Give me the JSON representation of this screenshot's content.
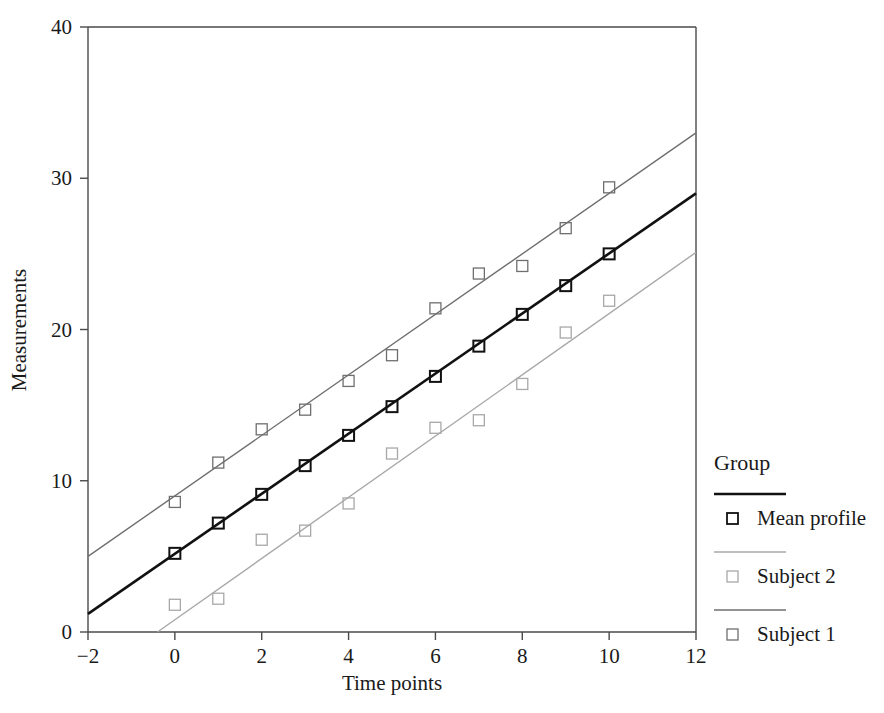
{
  "chart_data": {
    "type": "scatter",
    "title": "",
    "xlabel": "Time points",
    "ylabel": "Measurements",
    "xlim": [
      -2,
      12
    ],
    "ylim": [
      0,
      40
    ],
    "xticks": [
      -2,
      0,
      2,
      4,
      6,
      8,
      10,
      12
    ],
    "xtick_labels": [
      "−2",
      "0",
      "2",
      "4",
      "6",
      "8",
      "10",
      "12"
    ],
    "yticks": [
      0,
      10,
      20,
      30,
      40
    ],
    "ytick_labels": [
      "0",
      "10",
      "20",
      "30",
      "40"
    ],
    "grid": false,
    "legend_position": "right",
    "legend_title": "Group",
    "marker": "open-square",
    "series": [
      {
        "name": "Subject 1",
        "color": "#6f6f6f",
        "line_color": "#6f6f6f",
        "marker_color": "#6f6f6f",
        "x": [
          0,
          1,
          2,
          3,
          4,
          5,
          6,
          7,
          8,
          9,
          10
        ],
        "values": [
          8.6,
          11.2,
          13.4,
          14.7,
          16.6,
          18.3,
          21.4,
          23.7,
          24.2,
          26.7,
          29.4
        ],
        "fit_line": {
          "x0": -2,
          "y0": 5.0,
          "x1": 12,
          "y1": 33.0
        }
      },
      {
        "name": "Mean profile",
        "color": "#111111",
        "line_color": "#111111",
        "marker_color": "#111111",
        "x": [
          0,
          1,
          2,
          3,
          4,
          5,
          6,
          7,
          8,
          9,
          10
        ],
        "values": [
          5.2,
          7.2,
          9.1,
          11.0,
          13.0,
          14.9,
          16.9,
          18.9,
          21.0,
          22.9,
          25.0
        ],
        "fit_line": {
          "x0": -2,
          "y0": 1.2,
          "x1": 12,
          "y1": 29.0
        }
      },
      {
        "name": "Subject 2",
        "color": "#a8a8a8",
        "line_color": "#a8a8a8",
        "marker_color": "#a8a8a8",
        "x": [
          0,
          1,
          2,
          3,
          4,
          5,
          6,
          7,
          8,
          9,
          10
        ],
        "values": [
          1.8,
          2.2,
          6.1,
          6.7,
          8.5,
          11.8,
          13.5,
          14.0,
          16.4,
          19.8,
          21.9
        ],
        "fit_line": {
          "x0": -0.4,
          "y0": 0.0,
          "x1": 12,
          "y1": 25.1
        }
      }
    ]
  },
  "axes": {
    "x_label": "Time points",
    "y_label": "Measurements"
  },
  "legend": {
    "title": "Group",
    "entries": [
      {
        "label": "Mean profile",
        "color": "#111111"
      },
      {
        "label": "Subject 2",
        "color": "#a8a8a8"
      },
      {
        "label": "Subject 1",
        "color": "#6f6f6f"
      }
    ]
  }
}
